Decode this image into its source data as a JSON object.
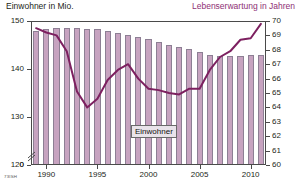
{
  "header": {
    "left_title": "Einwohner in Mio.",
    "right_title": "Lebenserwartung in Jahren",
    "left_color": "#231f20",
    "right_color": "#8e2f74"
  },
  "series_label": "Einwohner",
  "source_code": "73ISH",
  "colors": {
    "bar_fill": "#c7a3c0",
    "bar_border": "#8d7f94",
    "line": "#7d2060",
    "axis": "#4a4a4a"
  },
  "chart_data": {
    "type": "bar",
    "title": "",
    "subtitle": "",
    "xlabel": "",
    "ylabel": "Einwohner in Mio.",
    "y2label": "Lebenserwartung in Jahren",
    "grid": false,
    "legend_position": "inline",
    "axis_break": true,
    "categories": [
      1989,
      1990,
      1991,
      1992,
      1993,
      1994,
      1995,
      1996,
      1997,
      1998,
      1999,
      2000,
      2001,
      2002,
      2003,
      2004,
      2005,
      2006,
      2007,
      2008,
      2009,
      2010,
      2011
    ],
    "xticks": [
      1990,
      1995,
      2000,
      2005,
      2010
    ],
    "ylim": [
      120,
      150
    ],
    "yticks": [
      120,
      130,
      140,
      150
    ],
    "ytick_extra": 0,
    "y2lim": [
      60,
      70
    ],
    "y2ticks": [
      60,
      61,
      62,
      63,
      64,
      65,
      66,
      67,
      68,
      69,
      70
    ],
    "series": [
      {
        "name": "Einwohner",
        "kind": "bar",
        "axis": "left",
        "unit": "Mio.",
        "values": [
          148.0,
          148.3,
          148.5,
          148.5,
          148.6,
          148.4,
          148.3,
          148.0,
          147.5,
          147.1,
          146.7,
          146.3,
          145.6,
          145.0,
          144.6,
          144.2,
          143.5,
          143.0,
          142.8,
          142.8,
          142.7,
          142.9,
          143.0
        ]
      },
      {
        "name": "Lebenserwartung",
        "kind": "line",
        "axis": "right",
        "unit": "Jahre",
        "values": [
          69.5,
          69.2,
          69.0,
          67.9,
          65.1,
          64.0,
          64.6,
          65.9,
          66.6,
          67.0,
          66.0,
          65.3,
          65.2,
          65.0,
          64.9,
          65.3,
          65.3,
          66.6,
          67.5,
          67.9,
          68.7,
          68.8,
          69.8
        ]
      }
    ]
  }
}
